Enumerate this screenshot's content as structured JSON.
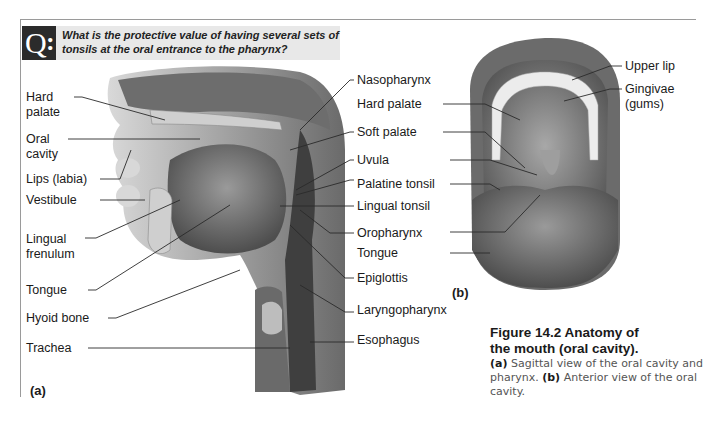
{
  "question": {
    "badge": "Q",
    "text": "What is the protective value of having several sets of tonsils at the oral entrance to the pharynx?"
  },
  "figure_a": {
    "panel_label": "(a)",
    "left_labels": [
      {
        "line1": "Hard",
        "line2": "palate"
      },
      {
        "line1": "Oral",
        "line2": "cavity"
      },
      {
        "line1": "Lips (labia)",
        "line2": ""
      },
      {
        "line1": "Vestibule",
        "line2": ""
      },
      {
        "line1": "Lingual",
        "line2": "frenulum"
      },
      {
        "line1": "Tongue",
        "line2": ""
      },
      {
        "line1": "Hyoid bone",
        "line2": ""
      },
      {
        "line1": "Trachea",
        "line2": ""
      }
    ],
    "right_labels": [
      "Nasopharynx",
      "Soft palate",
      "Uvula",
      "Palatine tonsil",
      "Lingual tonsil",
      "Oropharynx",
      "Epiglottis",
      "Laryngopharynx",
      "Esophagus"
    ]
  },
  "figure_b": {
    "panel_label": "(b)",
    "left_labels": [
      "Hard palate",
      "Tongue"
    ],
    "right_labels": [
      {
        "line1": "Upper lip",
        "line2": ""
      },
      {
        "line1": "Gingivae",
        "line2": "(gums)"
      }
    ]
  },
  "caption": {
    "title_line1": "Figure 14.2  Anatomy of",
    "title_line2": "the mouth (oral cavity).",
    "a_tag": "(a)",
    "a_text": " Sagittal view of the oral cavity and pharynx. ",
    "b_tag": "(b)",
    "b_text": " Anterior view of the oral cavity."
  },
  "colors": {
    "frame": "#9a9a9a",
    "question_bg": "#e8e8e8",
    "badge_bg": "#2b2b2b",
    "tissue_dark": "#4a4a4a",
    "tissue_mid": "#8c8c8c",
    "tissue_light": "#d6d6d6"
  }
}
